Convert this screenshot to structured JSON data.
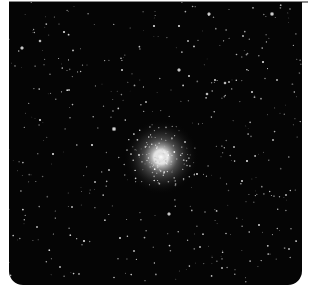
{
  "image": {
    "subject": "globular star cluster in a dense star field",
    "background_color": "#050505",
    "margin_color": "#ffffff",
    "rule_color": "#8a8a8a",
    "cluster": {
      "cx": 152,
      "cy": 155,
      "core_radius": 9,
      "halo_radius": 38
    },
    "bright_stars": [
      [
        13,
        46,
        2.2
      ],
      [
        31,
        39,
        1.8
      ],
      [
        55,
        30,
        1.6
      ],
      [
        145,
        24,
        1.6
      ],
      [
        170,
        24,
        1.6
      ],
      [
        200,
        12,
        2.2
      ],
      [
        263,
        12,
        2.4
      ],
      [
        105,
        127,
        2.6
      ],
      [
        170,
        68,
        2.2
      ],
      [
        180,
        74,
        1.4
      ],
      [
        113,
        68,
        1.4
      ],
      [
        83,
        143,
        1.6
      ],
      [
        31,
        118,
        1.6
      ],
      [
        198,
        92,
        1.8
      ],
      [
        216,
        81,
        1.8
      ],
      [
        206,
        78,
        1.4
      ],
      [
        220,
        80,
        1.2
      ],
      [
        254,
        60,
        1.6
      ],
      [
        243,
        90,
        1.4
      ],
      [
        160,
        212,
        2.2
      ],
      [
        238,
        159,
        1.6
      ],
      [
        233,
        179,
        1.4
      ],
      [
        250,
        223,
        1.4
      ],
      [
        277,
        193,
        1.2
      ],
      [
        44,
        152,
        1.6
      ],
      [
        75,
        239,
        1.6
      ],
      [
        111,
        236,
        1.4
      ],
      [
        51,
        265,
        1.2
      ],
      [
        86,
        180,
        1.2
      ],
      [
        125,
        249,
        1.2
      ],
      [
        213,
        266,
        1.2
      ],
      [
        28,
        225,
        1.2
      ],
      [
        179,
        39,
        1.2
      ],
      [
        60,
        88,
        1.2
      ],
      [
        130,
        153,
        1.4
      ],
      [
        176,
        140,
        1.2
      ],
      [
        188,
        172,
        1.4
      ],
      [
        225,
        145,
        1.2
      ],
      [
        264,
        138,
        1.2
      ],
      [
        137,
        100,
        1.2
      ],
      [
        100,
        168,
        1.2
      ],
      [
        63,
        205,
        1.2
      ],
      [
        280,
        247,
        1.2
      ],
      [
        191,
        245,
        1.2
      ],
      [
        268,
        78,
        1.2
      ],
      [
        234,
        34,
        1.2
      ]
    ],
    "faint_star_count": 420
  }
}
